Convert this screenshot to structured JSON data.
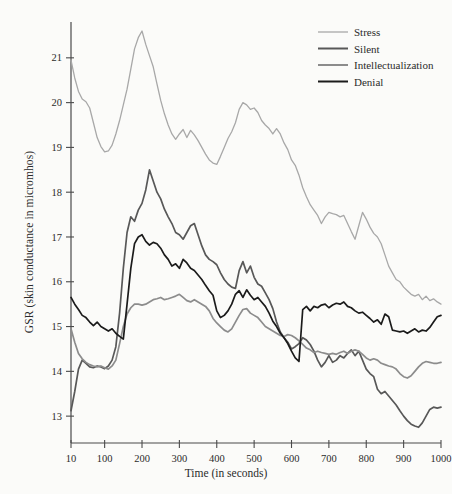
{
  "chart_data": {
    "type": "line",
    "title": "",
    "xlabel": "Time (in seconds)",
    "ylabel": "GSR (skin conductance in micromhos)",
    "xlim": [
      10,
      1000
    ],
    "ylim": [
      12.4,
      21.8
    ],
    "xticks": [
      10,
      100,
      200,
      300,
      400,
      500,
      600,
      700,
      800,
      900,
      1000
    ],
    "yticks": [
      13,
      14,
      15,
      16,
      17,
      18,
      19,
      20,
      21
    ],
    "grid": false,
    "legend_position": "top-right",
    "x": [
      10,
      20,
      30,
      40,
      50,
      60,
      70,
      80,
      90,
      100,
      110,
      120,
      130,
      140,
      150,
      160,
      170,
      180,
      190,
      200,
      210,
      220,
      230,
      240,
      250,
      260,
      270,
      280,
      290,
      300,
      310,
      320,
      330,
      340,
      350,
      360,
      370,
      380,
      390,
      400,
      410,
      420,
      430,
      440,
      450,
      460,
      470,
      480,
      490,
      500,
      510,
      520,
      530,
      540,
      550,
      560,
      570,
      580,
      590,
      600,
      610,
      620,
      630,
      640,
      650,
      660,
      670,
      680,
      690,
      700,
      710,
      720,
      730,
      740,
      750,
      760,
      770,
      780,
      790,
      800,
      810,
      820,
      830,
      840,
      850,
      860,
      870,
      880,
      890,
      900,
      910,
      920,
      930,
      940,
      950,
      960,
      970,
      980,
      990,
      1000
    ],
    "series": [
      {
        "name": "Stress",
        "color": "#a8a8a8",
        "width": 1.3,
        "values": [
          20.95,
          20.55,
          20.25,
          20.08,
          20.02,
          19.88,
          19.55,
          19.22,
          19.02,
          18.9,
          18.92,
          19.05,
          19.3,
          19.6,
          19.95,
          20.3,
          20.75,
          21.2,
          21.45,
          21.6,
          21.3,
          21.05,
          20.8,
          20.42,
          20.05,
          19.75,
          19.5,
          19.3,
          19.18,
          19.3,
          19.4,
          19.22,
          19.38,
          19.28,
          19.15,
          19.0,
          18.85,
          18.72,
          18.65,
          18.62,
          18.8,
          19.0,
          19.2,
          19.35,
          19.55,
          19.85,
          20.0,
          19.95,
          19.85,
          19.88,
          19.78,
          19.6,
          19.5,
          19.42,
          19.3,
          19.42,
          19.3,
          19.1,
          18.95,
          18.72,
          18.6,
          18.38,
          18.1,
          17.9,
          17.72,
          17.6,
          17.48,
          17.3,
          17.45,
          17.55,
          17.52,
          17.5,
          17.45,
          17.48,
          17.3,
          17.12,
          16.95,
          17.25,
          17.55,
          17.4,
          17.22,
          17.08,
          17.0,
          16.85,
          16.6,
          16.35,
          16.2,
          16.05,
          16.0,
          15.88,
          15.8,
          15.72,
          15.68,
          15.72,
          15.6,
          15.68,
          15.58,
          15.62,
          15.55,
          15.5
        ]
      },
      {
        "name": "Silent",
        "color": "#585858",
        "width": 1.7,
        "values": [
          13.12,
          13.55,
          14.05,
          14.25,
          14.18,
          14.1,
          14.08,
          14.12,
          14.1,
          14.06,
          14.12,
          14.25,
          14.55,
          15.3,
          16.3,
          17.1,
          17.45,
          17.35,
          17.6,
          17.75,
          18.05,
          18.5,
          18.25,
          18.0,
          17.85,
          17.62,
          17.45,
          17.3,
          17.1,
          17.05,
          16.95,
          17.1,
          17.25,
          17.3,
          17.05,
          16.8,
          16.6,
          16.5,
          16.45,
          16.38,
          16.2,
          16.05,
          15.95,
          15.88,
          15.85,
          16.25,
          16.45,
          16.2,
          16.35,
          16.1,
          15.95,
          15.9,
          15.75,
          15.6,
          15.4,
          15.1,
          14.88,
          14.75,
          14.65,
          14.5,
          14.55,
          14.62,
          14.75,
          14.7,
          14.6,
          14.45,
          14.25,
          14.1,
          14.2,
          14.35,
          14.2,
          14.25,
          14.35,
          14.3,
          14.4,
          14.48,
          14.35,
          14.45,
          14.25,
          14.05,
          13.95,
          13.88,
          13.6,
          13.5,
          13.55,
          13.45,
          13.35,
          13.25,
          13.12,
          13.0,
          12.9,
          12.82,
          12.78,
          12.75,
          12.85,
          13.0,
          13.15,
          13.2,
          13.18,
          13.2
        ]
      },
      {
        "name": "Intellectualization",
        "color": "#8c8c8c",
        "width": 1.7,
        "values": [
          14.95,
          14.65,
          14.4,
          14.28,
          14.2,
          14.15,
          14.12,
          14.1,
          14.12,
          14.08,
          14.05,
          14.12,
          14.25,
          14.62,
          15.0,
          15.28,
          15.42,
          15.5,
          15.5,
          15.48,
          15.5,
          15.55,
          15.6,
          15.62,
          15.65,
          15.6,
          15.62,
          15.65,
          15.68,
          15.72,
          15.65,
          15.58,
          15.55,
          15.6,
          15.55,
          15.5,
          15.45,
          15.35,
          15.18,
          15.08,
          15.0,
          14.92,
          14.88,
          14.95,
          15.1,
          15.25,
          15.38,
          15.4,
          15.3,
          15.25,
          15.2,
          15.1,
          15.0,
          14.95,
          14.9,
          14.85,
          14.8,
          14.78,
          14.82,
          14.8,
          14.75,
          14.68,
          14.6,
          14.52,
          14.48,
          14.42,
          14.45,
          14.42,
          14.4,
          14.38,
          14.4,
          14.38,
          14.42,
          14.45,
          14.4,
          14.45,
          14.48,
          14.45,
          14.38,
          14.3,
          14.25,
          14.28,
          14.25,
          14.18,
          14.15,
          14.12,
          14.1,
          14.05,
          13.95,
          13.88,
          13.85,
          13.9,
          14.0,
          14.1,
          14.18,
          14.22,
          14.2,
          14.18,
          14.18,
          14.2
        ]
      },
      {
        "name": "Denial",
        "color": "#1b1b1b",
        "width": 1.7,
        "values": [
          15.65,
          15.5,
          15.38,
          15.25,
          15.2,
          15.1,
          15.02,
          15.1,
          15.0,
          14.95,
          14.9,
          14.95,
          14.85,
          14.78,
          14.72,
          15.5,
          16.3,
          16.85,
          17.0,
          17.05,
          16.9,
          16.82,
          16.88,
          16.85,
          16.75,
          16.6,
          16.5,
          16.35,
          16.4,
          16.3,
          16.5,
          16.42,
          16.3,
          16.25,
          16.15,
          16.05,
          15.92,
          15.8,
          15.7,
          15.35,
          15.2,
          15.25,
          15.35,
          15.5,
          15.72,
          15.8,
          15.65,
          15.82,
          15.7,
          15.6,
          15.65,
          15.55,
          15.45,
          15.3,
          15.12,
          15.0,
          14.85,
          14.75,
          14.62,
          14.45,
          14.3,
          14.22,
          15.38,
          15.45,
          15.35,
          15.45,
          15.42,
          15.48,
          15.5,
          15.42,
          15.48,
          15.52,
          15.5,
          15.55,
          15.45,
          15.42,
          15.35,
          15.3,
          15.32,
          15.25,
          15.18,
          15.1,
          15.15,
          15.05,
          15.28,
          15.22,
          14.92,
          14.9,
          14.88,
          14.9,
          14.85,
          14.9,
          14.95,
          14.88,
          14.92,
          14.9,
          14.98,
          15.1,
          15.22,
          15.25
        ]
      }
    ]
  },
  "legend": {
    "items": [
      {
        "label": "Stress"
      },
      {
        "label": "Silent"
      },
      {
        "label": "Intellectualization"
      },
      {
        "label": "Denial"
      }
    ]
  }
}
